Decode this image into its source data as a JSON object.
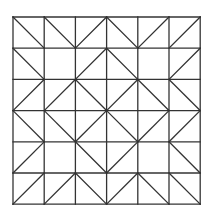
{
  "diagram": {
    "type": "quilt-grid",
    "rows": 6,
    "cols": 6,
    "origin": [
      13,
      17
    ],
    "cell_size": 31.2,
    "stroke_color": "#333333",
    "background": "#ffffff",
    "legend": {
      "\\": "diagonal top-left to bottom-right",
      "/": "diagonal bottom-left to top-right",
      ".": "no diagonal"
    },
    "cells": [
      [
        "\\",
        "\\",
        "/",
        "\\",
        "/",
        "/"
      ],
      [
        "\\",
        ".",
        "/",
        "\\",
        ".",
        "/"
      ],
      [
        "/",
        "/",
        "\\",
        "/",
        "\\",
        "\\"
      ],
      [
        "\\",
        "\\",
        "/",
        "\\",
        "/",
        "/"
      ],
      [
        "/",
        ".",
        "\\",
        "/",
        ".",
        "\\"
      ],
      [
        "/",
        "/",
        "\\",
        "/",
        "\\",
        "\\"
      ]
    ]
  }
}
